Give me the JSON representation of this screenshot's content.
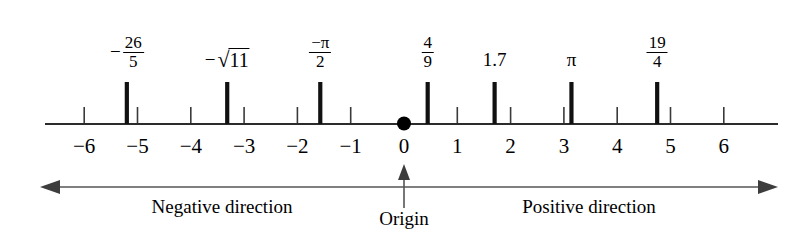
{
  "figure": {
    "type": "number-line",
    "background_color": "#ffffff",
    "ink_color": "#000000"
  },
  "chart_data": {
    "type": "scatter",
    "title": "",
    "xlabel": "",
    "ylabel": "",
    "orientation": "horizontal",
    "axis": {
      "min": -6.6,
      "max": 6.6,
      "origin": 0,
      "tick_step": 1,
      "grid": false,
      "pixel_origin_x": 404,
      "pixel_units_per_step": 53.3,
      "pixel_axis_y": 124
    },
    "tick_labels": [
      "-6",
      "-5",
      "-4",
      "-3",
      "-2",
      "-1",
      "0",
      "1",
      "2",
      "3",
      "4",
      "5",
      "6"
    ],
    "tick_values": [
      -6,
      -5,
      -4,
      -3,
      -2,
      -1,
      0,
      1,
      2,
      3,
      4,
      5,
      6
    ],
    "origin_marker": {
      "value": 0,
      "shape": "filled-circle",
      "label": "0"
    },
    "plotted_points": [
      {
        "id": "neg-26-over-5",
        "value": -5.2,
        "label_kind": "fraction",
        "label_sign": "-",
        "numerator": "26",
        "denominator": "5",
        "label_text": "-26/5"
      },
      {
        "id": "neg-sqrt-11",
        "value": -3.3166,
        "label_kind": "radical",
        "label_sign": "-",
        "radicand": "11",
        "label_text": "-√11"
      },
      {
        "id": "neg-pi-over-2",
        "value": -1.5708,
        "label_kind": "fraction-signed-numerator",
        "numerator": "−π",
        "denominator": "2",
        "label_text": "-π/2"
      },
      {
        "id": "four-ninths",
        "value": 0.4444,
        "label_kind": "fraction",
        "label_sign": "",
        "numerator": "4",
        "denominator": "9",
        "label_text": "4/9"
      },
      {
        "id": "one-point-seven",
        "value": 1.7,
        "label_kind": "plain",
        "label_text": "1.7"
      },
      {
        "id": "pi",
        "value": 3.1416,
        "label_kind": "plain",
        "label_text": "π"
      },
      {
        "id": "nineteen-fourths",
        "value": 4.75,
        "label_kind": "fraction",
        "label_sign": "",
        "numerator": "19",
        "denominator": "4",
        "label_text": "19/4"
      }
    ],
    "annotations": [
      {
        "id": "negative-direction",
        "text": "Negative direction",
        "position": "below-left"
      },
      {
        "id": "origin",
        "text": "Origin",
        "position": "below-center",
        "has_pointer_arrow": true
      },
      {
        "id": "positive-direction",
        "text": "Positive direction",
        "position": "below-right"
      }
    ]
  },
  "direction_bar": {
    "left_arrow": "arrow-left",
    "right_arrow": "arrow-right",
    "negative_label": "Negative direction",
    "positive_label": "Positive direction",
    "origin_label": "Origin"
  }
}
